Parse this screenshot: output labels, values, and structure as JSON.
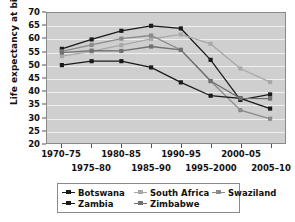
{
  "chart_data": {
    "type": "line",
    "title": "",
    "xlabel": "",
    "ylabel": "Life expectancy at birth (years)",
    "ylim": [
      20,
      70
    ],
    "ytick_step": 5,
    "yticks": [
      70,
      65,
      60,
      55,
      50,
      45,
      40,
      35,
      30,
      25,
      20
    ],
    "grid": true,
    "grid_color": "#efefef",
    "plot_background": "#cfcfcf",
    "legend_position": "bottom",
    "categories": [
      "1970–75",
      "1975–80",
      "1980–85",
      "1985–90",
      "1990–95",
      "1995–2000",
      "2000–05",
      "2005–10"
    ],
    "x_label_rows": [
      [
        "1970–75",
        "1980–85",
        "1990–95",
        "2000–05"
      ],
      [
        "1975–80",
        "1985–90",
        "1995–2000",
        "2005–10"
      ]
    ],
    "series": [
      {
        "name": "Botswana",
        "color": "#1a1a1a",
        "values": [
          56.3,
          59.9,
          63.2,
          65.1,
          64.1,
          52.1,
          36.8,
          38.9
        ]
      },
      {
        "name": "South Africa",
        "color": "#a8a8a8",
        "values": [
          53.5,
          55.3,
          57.7,
          60.1,
          61.8,
          58.2,
          48.8,
          43.6
        ]
      },
      {
        "name": "Swaziland",
        "color": "#8a8a8a",
        "values": [
          55.3,
          57.8,
          60.2,
          61.4,
          55.9,
          44.0,
          32.9,
          29.6
        ]
      },
      {
        "name": "Zambia",
        "color": "#1a1a1a",
        "values": [
          50.1,
          51.6,
          51.6,
          49.2,
          43.5,
          38.4,
          37.4,
          33.5
        ]
      },
      {
        "name": "Zimbabwe",
        "color": "#707070",
        "values": [
          54.9,
          55.6,
          55.5,
          57.2,
          55.9,
          44.0,
          37.4,
          37.3
        ]
      }
    ],
    "legend_rows": [
      [
        "Botswana",
        "South Africa",
        "Swaziland"
      ],
      [
        "Zambia",
        "Zimbabwe"
      ]
    ]
  }
}
